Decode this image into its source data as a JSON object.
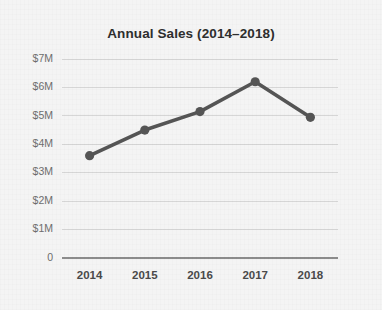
{
  "chart_data": {
    "type": "line",
    "title": "Annual Sales (2014–2018)",
    "xlabel": "",
    "ylabel": "",
    "categories": [
      "2014",
      "2015",
      "2016",
      "2017",
      "2018"
    ],
    "values": [
      3.6,
      4.5,
      5.15,
      6.2,
      4.95
    ],
    "value_unit": "millions of dollars",
    "series": [
      {
        "name": "Annual Sales",
        "values": [
          3.6,
          4.5,
          5.15,
          6.2,
          4.95
        ]
      }
    ],
    "ylim": [
      0,
      7
    ],
    "y_tick_values": [
      7,
      6,
      5,
      4,
      3,
      2,
      1,
      0
    ],
    "y_tick_labels": [
      "$7M",
      "$6M",
      "$5M",
      "$4M",
      "$3M",
      "$2M",
      "$1M",
      "0"
    ],
    "x_tick_labels": [
      "2014",
      "2015",
      "2016",
      "2017",
      "2018"
    ],
    "grid": true,
    "grid_axis": "y",
    "legend": false,
    "legend_position": "none",
    "markers": true,
    "annotations": []
  },
  "style": {
    "background_color": "#f4f4f4",
    "line_color": "#555555",
    "marker_color": "#555555",
    "gridline_color": "#d6d6d6",
    "axis_color": "#8c8c8c",
    "title_color": "#2e2e2e",
    "y_label_color": "#6e6e6e",
    "x_label_color": "#4a4a4a"
  }
}
